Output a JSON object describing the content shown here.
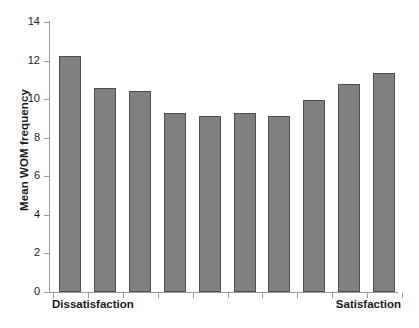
{
  "chart_data": {
    "type": "bar",
    "title": "",
    "xlabel": "",
    "ylabel": "Mean WOM frequency",
    "categories": [
      "1",
      "2",
      "3",
      "4",
      "5",
      "6",
      "7",
      "8",
      "9",
      "10"
    ],
    "values": [
      12.25,
      10.6,
      10.4,
      9.3,
      9.15,
      9.3,
      9.15,
      9.95,
      10.8,
      11.35
    ],
    "ylim": [
      0,
      14
    ],
    "ytick_labels": [
      "0",
      "2",
      "4",
      "6",
      "8",
      "10",
      "12",
      "14"
    ],
    "ytick_values": [
      0,
      2,
      4,
      6,
      8,
      10,
      12,
      14
    ],
    "x_axis_endpoint_labels": {
      "left": "Dissatisfaction",
      "right": "Satisfaction"
    },
    "grid": false,
    "legend": null,
    "colors": {
      "bar_fill": "#808080",
      "bar_edge": "#4d4d4d",
      "axis": "#9a9a9a",
      "text": "#1a1a1a",
      "background": "#ffffff"
    }
  }
}
